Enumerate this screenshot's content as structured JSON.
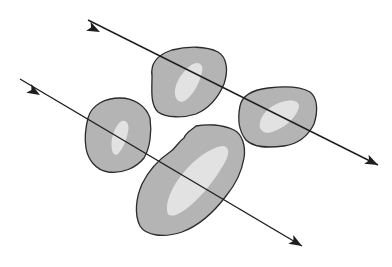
{
  "diagram": {
    "width": 392,
    "height": 267,
    "background": "#ffffff",
    "colors": {
      "blob_fill": "#b4b4b4",
      "blob_fill_dark": "#a2a2a2",
      "blob_highlight": "#eaeaea",
      "outline": "#2a2a2a",
      "arrow": "#1e1e1e"
    },
    "blobs": [
      {
        "id": "blob-top-center",
        "path": "M152,76 C150,62 160,54 172,50 C188,46 206,46 218,52 C228,58 228,72 224,84 C218,98 210,108 196,114 C184,118 166,118 158,112 C150,104 152,90 152,76 Z",
        "highlight": "M176,98 C172,88 180,74 190,66 C198,60 204,64 202,72 C200,82 194,94 186,100 C182,103 178,102 176,98 Z"
      },
      {
        "id": "blob-left",
        "path": "M88,118 C92,104 106,98 120,98 C134,98 146,106 150,118 C152,132 150,148 144,158 C136,168 122,174 108,172 C96,170 88,160 86,148 C84,136 86,126 88,118 Z",
        "highlight": "M112,150 C110,140 114,128 120,122 C126,118 130,124 128,132 C126,142 122,150 118,154 C115,156 113,154 112,150 Z"
      },
      {
        "id": "blob-right",
        "path": "M240,106 C242,96 252,90 268,88 C284,86 300,86 310,92 C318,98 318,112 314,124 C308,136 298,144 284,146 C268,148 254,148 246,140 C238,130 238,116 240,106 Z",
        "highlight": "M260,128 C258,118 268,106 282,102 C294,98 302,102 298,110 C294,120 284,128 272,132 C266,134 262,132 260,128 Z"
      },
      {
        "id": "blob-bottom-center",
        "path": "M184,138 C186,132 192,130 196,126 C206,124 222,124 234,130 C242,134 246,146 244,158 C242,170 236,184 226,196 C214,212 198,226 182,232 C164,238 146,236 140,226 C134,214 136,198 142,184 C148,172 158,160 170,152 C176,148 178,142 184,138 Z",
        "highlight": "M168,214 C164,204 172,186 184,172 C196,158 210,148 222,146 C230,146 230,154 224,164 C216,178 204,194 190,206 C180,214 172,218 168,214 Z"
      }
    ],
    "arrows": [
      {
        "id": "arrow-top",
        "x1": 88,
        "y1": 20,
        "x2": 378,
        "y2": 165,
        "tail_head": {
          "x": 100,
          "y": 32,
          "angle": 26.6
        },
        "end_head": {
          "x": 378,
          "y": 165,
          "angle": 26.6
        }
      },
      {
        "id": "arrow-bottom",
        "x1": 20,
        "y1": 79,
        "x2": 302,
        "y2": 246,
        "tail_head": {
          "x": 40,
          "y": 95,
          "angle": 30.6
        },
        "end_head": {
          "x": 302,
          "y": 246,
          "angle": 30.6
        }
      }
    ]
  }
}
